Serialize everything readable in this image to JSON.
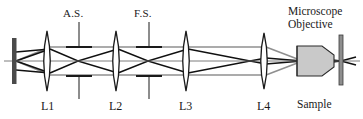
{
  "figure": {
    "type": "optical-ray-diagram",
    "background_color": "#ffffff",
    "ink_color": "#1a1a1a",
    "ray_color_marginal": "#8c8c8c",
    "ray_color_chief": "#111111",
    "objective_fill": "#c9c9c9",
    "source_bar_color": "#4a4a4a",
    "axis_y": 61
  },
  "labels": {
    "aperture_stop": "A.S.",
    "field_stop": "F.S.",
    "lens_1": "L1",
    "lens_2": "L2",
    "lens_3": "L3",
    "lens_4": "L4",
    "objective_line_1": "Microscope",
    "objective_line_2": "Objective",
    "sample": "Sample"
  },
  "components": [
    {
      "name": "source-bar",
      "label": "",
      "x": 14,
      "kind": "bar"
    },
    {
      "name": "lens-l1",
      "label": "L1",
      "x": 50,
      "kind": "lens"
    },
    {
      "name": "aperture-stop",
      "label": "A.S.",
      "x": 78,
      "kind": "stop"
    },
    {
      "name": "lens-l2",
      "label": "L2",
      "x": 118,
      "kind": "lens"
    },
    {
      "name": "field-stop",
      "label": "F.S.",
      "x": 148,
      "kind": "stop"
    },
    {
      "name": "lens-l3",
      "label": "L3",
      "x": 188,
      "kind": "lens"
    },
    {
      "name": "lens-l4",
      "label": "L4",
      "x": 266,
      "kind": "lens"
    },
    {
      "name": "objective",
      "label": "Microscope Objective",
      "x": 316,
      "kind": "objective"
    },
    {
      "name": "sample-plane",
      "label": "Sample",
      "x": 345,
      "kind": "bar"
    }
  ]
}
